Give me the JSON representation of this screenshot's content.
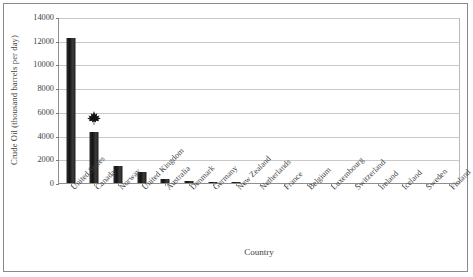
{
  "chart_data": {
    "type": "bar",
    "title": "",
    "xlabel": "Country",
    "ylabel": "Crude Oil (thousand barrels per day)",
    "ylim": [
      0,
      14000
    ],
    "ytick_values": [
      0,
      2000,
      4000,
      6000,
      8000,
      10000,
      12000,
      14000
    ],
    "ytick_labels": [
      "0",
      "2000",
      "4000",
      "6000",
      "8000",
      "10000",
      "12000",
      "14000"
    ],
    "grid": true,
    "legend": false,
    "bar_color": "#1a1a1a",
    "categories": [
      "United States",
      "Canada",
      "Norway",
      "United Kingdom",
      "Australia",
      "Denmark",
      "Germany",
      "New Zealand",
      "Netherlands",
      "France",
      "Belgium",
      "Luxembourg",
      "Switzerland",
      "Ireland",
      "Iceland",
      "Sweden",
      "Finland"
    ],
    "values": [
      12200,
      4300,
      1400,
      900,
      350,
      130,
      50,
      40,
      20,
      15,
      5,
      0,
      0,
      0,
      0,
      0,
      0
    ],
    "annotations": [
      {
        "name": "maple-leaf-marker",
        "icon": "maple-leaf-icon",
        "category": "Canada",
        "value": 5600
      }
    ]
  }
}
